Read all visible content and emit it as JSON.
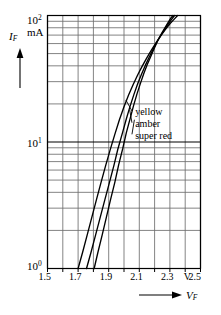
{
  "chart_data": {
    "type": "line",
    "title": "",
    "xlabel": "V_F",
    "ylabel": "I_F",
    "x_unit": "V",
    "y_unit": "mA",
    "x_scale": "linear",
    "y_scale": "log",
    "xlim": [
      1.5,
      2.5
    ],
    "ylim": [
      1,
      100
    ],
    "grid": true,
    "legend_position": "inside-right",
    "x_ticks": [
      1.5,
      1.6,
      1.7,
      1.8,
      1.9,
      2.0,
      2.1,
      2.2,
      2.3,
      2.4,
      2.5
    ],
    "x_tick_labels": [
      "1.5",
      "",
      "1.7",
      "",
      "1.9",
      "",
      "2.1",
      "",
      "2.3",
      "",
      "2.5"
    ],
    "y_tick_labels": [
      "10^0",
      "10^1",
      "10^2"
    ],
    "y_minor_decades": [
      2,
      3,
      4,
      5,
      6,
      7,
      8,
      9
    ],
    "series": [
      {
        "name": "yellow",
        "points": [
          [
            1.7,
            1.0
          ],
          [
            1.73,
            1.35
          ],
          [
            1.76,
            1.85
          ],
          [
            1.79,
            2.55
          ],
          [
            1.82,
            3.5
          ],
          [
            1.85,
            4.8
          ],
          [
            1.88,
            6.5
          ],
          [
            1.91,
            8.7
          ],
          [
            1.94,
            11.5
          ],
          [
            1.97,
            15.0
          ],
          [
            2.0,
            19.0
          ],
          [
            2.03,
            23.5
          ],
          [
            2.06,
            28.5
          ],
          [
            2.09,
            34.0
          ],
          [
            2.12,
            40.0
          ],
          [
            2.15,
            46.5
          ],
          [
            2.18,
            53.5
          ],
          [
            2.21,
            61.0
          ],
          [
            2.24,
            69.0
          ],
          [
            2.27,
            77.5
          ],
          [
            2.3,
            86.0
          ],
          [
            2.33,
            94.0
          ],
          [
            2.35,
            100.0
          ]
        ]
      },
      {
        "name": "amber",
        "points": [
          [
            1.755,
            1.0
          ],
          [
            1.785,
            1.35
          ],
          [
            1.815,
            1.85
          ],
          [
            1.845,
            2.55
          ],
          [
            1.875,
            3.5
          ],
          [
            1.905,
            4.8
          ],
          [
            1.935,
            6.6
          ],
          [
            1.96,
            8.8
          ],
          [
            1.99,
            11.8
          ],
          [
            2.015,
            15.2
          ],
          [
            2.04,
            19.2
          ],
          [
            2.065,
            23.8
          ],
          [
            2.09,
            29.0
          ],
          [
            2.115,
            34.5
          ],
          [
            2.14,
            40.5
          ],
          [
            2.165,
            47.0
          ],
          [
            2.19,
            54.0
          ],
          [
            2.215,
            62.0
          ],
          [
            2.245,
            71.0
          ],
          [
            2.275,
            81.0
          ],
          [
            2.305,
            91.0
          ],
          [
            2.33,
            100.0
          ]
        ]
      },
      {
        "name": "super red",
        "points": [
          [
            1.805,
            1.0
          ],
          [
            1.83,
            1.35
          ],
          [
            1.858,
            1.85
          ],
          [
            1.885,
            2.55
          ],
          [
            1.912,
            3.5
          ],
          [
            1.94,
            4.8
          ],
          [
            1.965,
            6.6
          ],
          [
            1.992,
            8.9
          ],
          [
            2.015,
            11.8
          ],
          [
            2.04,
            15.3
          ],
          [
            2.062,
            19.3
          ],
          [
            2.085,
            24.0
          ],
          [
            2.108,
            29.2
          ],
          [
            2.13,
            35.0
          ],
          [
            2.152,
            41.0
          ],
          [
            2.175,
            47.5
          ],
          [
            2.198,
            55.0
          ],
          [
            2.22,
            63.0
          ],
          [
            2.248,
            73.0
          ],
          [
            2.278,
            84.0
          ],
          [
            2.305,
            95.0
          ],
          [
            2.32,
            100.0
          ]
        ]
      }
    ],
    "annotations": [
      {
        "text": "yellow",
        "x": 2.06,
        "y": 17.5
      },
      {
        "text": "amber",
        "x": 2.06,
        "y": 14.0
      },
      {
        "text": "super red",
        "x": 2.06,
        "y": 11.3
      }
    ]
  },
  "axes": {
    "y_top_label": "10",
    "y_top_exp": "2",
    "y_unit_label": "mA",
    "y_mid_label": "10",
    "y_mid_exp": "1",
    "y_bottom_label": "10",
    "y_bottom_exp": "0",
    "y_name": "I",
    "y_name_sub": "F",
    "x_name": "V",
    "x_name_sub": "F",
    "x_unit_marker": "V",
    "x_tick_1": "1.5",
    "x_tick_2": "1.7",
    "x_tick_3": "1.9",
    "x_tick_4": "2.1",
    "x_tick_5": "2.3",
    "x_tick_6": "2.5"
  },
  "legend": {
    "item_1": "yellow",
    "item_2": "amber",
    "item_3": "super red"
  },
  "style": {
    "curve_color": "#000000",
    "grid_color": "#6e6e6e",
    "axis_color": "#000000",
    "background": "#ffffff"
  }
}
